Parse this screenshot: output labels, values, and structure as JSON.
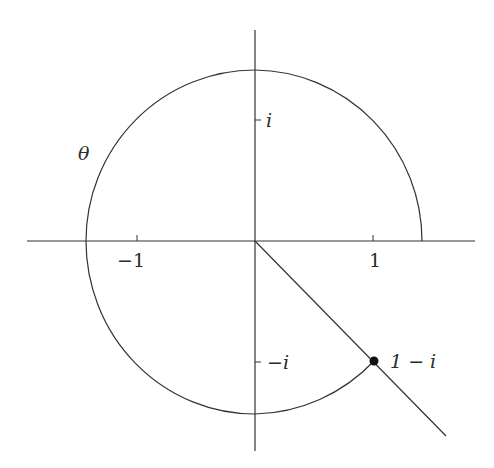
{
  "diagram": {
    "origin_px": [
      255,
      241
    ],
    "unit_px": 118,
    "colors": {
      "stroke": "#333333",
      "background": "#ffffff",
      "text": "#2a2a2a"
    },
    "labels": {
      "theta": "θ",
      "i": "i",
      "neg_i": "−i",
      "neg_one": "−1",
      "one": "1",
      "point": "1 − i"
    },
    "ticks": {
      "real": [
        -1,
        1
      ],
      "imaginary": [
        "i",
        "−i"
      ]
    },
    "curve": {
      "start": [
        1.414,
        0
      ],
      "end": [
        1,
        -1
      ],
      "direction": "counterclockwise",
      "approx_radius": 1.414
    },
    "ray": {
      "from": [
        0,
        0
      ],
      "direction": "1 - i",
      "label_point": "1 − i"
    },
    "marked_point": {
      "value": "1 − i",
      "coords": [
        1,
        -1
      ]
    }
  }
}
